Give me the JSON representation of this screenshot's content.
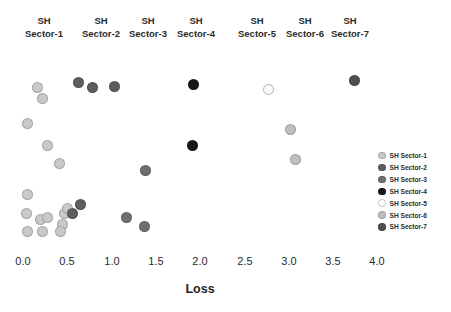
{
  "figure": {
    "faint_title": "",
    "background": "#ffffff"
  },
  "sector_headers": [
    {
      "line1": "SH",
      "line2": "Sector-1",
      "x": 44
    },
    {
      "line1": "SH",
      "line2": "Sector-2",
      "x": 101
    },
    {
      "line1": "SH",
      "line2": "Sector-3",
      "x": 148
    },
    {
      "line1": "SH",
      "line2": "Sector-4",
      "x": 196
    },
    {
      "line1": "SH",
      "line2": "Sector-5",
      "x": 257
    },
    {
      "line1": "SH",
      "line2": "Sector-6",
      "x": 305
    },
    {
      "line1": "SH",
      "line2": "Sector-7",
      "x": 350
    }
  ],
  "axis": {
    "xlabel": "Loss",
    "xticks": [
      "0.0",
      "0.5",
      "1.0",
      "1.5",
      "2.0",
      "2.5",
      "3.0",
      "3.5",
      "4.0"
    ],
    "xtick_px": [
      23,
      67,
      112,
      156,
      200,
      245,
      289,
      333,
      377
    ]
  },
  "legend": {
    "entries": [
      {
        "label": "SH Sector-1",
        "color": "#c9c9c9"
      },
      {
        "label": "SH Sector-2",
        "color": "#5e5e5e"
      },
      {
        "label": "SH Sector-3",
        "color": "#6f6f6f"
      },
      {
        "label": "SH Sector-4",
        "color": "#171717"
      },
      {
        "label": "SH Sector-5",
        "color": "#fbfbfb"
      },
      {
        "label": "SH Sector-6",
        "color": "#bfbfbf"
      },
      {
        "label": "SH Sector-7",
        "color": "#4f4f4f"
      }
    ]
  },
  "chart_data": {
    "type": "scatter",
    "title": "",
    "xlabel": "Loss",
    "ylabel": "",
    "xlim": [
      0.0,
      4.0
    ],
    "grid": false,
    "legend_position": "right",
    "series": [
      {
        "name": "SH Sector-1",
        "color": "#c9c9c9",
        "points": [
          {
            "x": 0.16,
            "y": 0.84
          },
          {
            "x": 0.22,
            "y": 0.78
          },
          {
            "x": 0.05,
            "y": 0.64
          },
          {
            "x": 0.28,
            "y": 0.52
          },
          {
            "x": 0.41,
            "y": 0.42
          },
          {
            "x": 0.05,
            "y": 0.25
          },
          {
            "x": 0.04,
            "y": 0.14
          },
          {
            "x": 0.2,
            "y": 0.11
          },
          {
            "x": 0.28,
            "y": 0.12
          },
          {
            "x": 0.05,
            "y": 0.04
          },
          {
            "x": 0.22,
            "y": 0.04
          },
          {
            "x": 0.47,
            "y": 0.14
          },
          {
            "x": 0.5,
            "y": 0.17
          },
          {
            "x": 0.45,
            "y": 0.08
          },
          {
            "x": 0.42,
            "y": 0.04
          }
        ]
      },
      {
        "name": "SH Sector-2",
        "color": "#5e5e5e",
        "points": [
          {
            "x": 0.63,
            "y": 0.87
          },
          {
            "x": 0.78,
            "y": 0.84
          },
          {
            "x": 1.03,
            "y": 0.85
          },
          {
            "x": 0.56,
            "y": 0.14
          },
          {
            "x": 0.65,
            "y": 0.19
          }
        ]
      },
      {
        "name": "SH Sector-3",
        "color": "#6f6f6f",
        "points": [
          {
            "x": 1.38,
            "y": 0.38
          },
          {
            "x": 1.17,
            "y": 0.12
          },
          {
            "x": 1.37,
            "y": 0.07
          }
        ]
      },
      {
        "name": "SH Sector-4",
        "color": "#171717",
        "points": [
          {
            "x": 1.93,
            "y": 0.86
          },
          {
            "x": 1.92,
            "y": 0.52
          }
        ]
      },
      {
        "name": "SH Sector-5",
        "color": "#fbfbfb",
        "points": [
          {
            "x": 2.77,
            "y": 0.83
          }
        ]
      },
      {
        "name": "SH Sector-6",
        "color": "#bfbfbf",
        "points": [
          {
            "x": 3.02,
            "y": 0.61
          },
          {
            "x": 3.08,
            "y": 0.44
          }
        ]
      },
      {
        "name": "SH Sector-7",
        "color": "#4f4f4f",
        "points": [
          {
            "x": 3.75,
            "y": 0.88
          }
        ]
      }
    ]
  }
}
